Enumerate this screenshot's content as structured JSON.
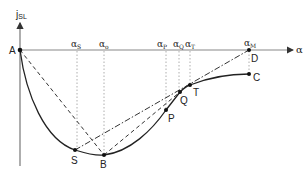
{
  "diagram": {
    "y_axis_label": "j",
    "y_axis_subscript": "SL",
    "x_axis_label": "α",
    "alpha_marks": [
      {
        "base": "α",
        "sub": "S",
        "x": 77
      },
      {
        "base": "α",
        "sub": "o",
        "x": 104
      },
      {
        "base": "α",
        "sub": "P",
        "x": 166
      },
      {
        "base": "α",
        "sub": "Q",
        "x": 179
      },
      {
        "base": "α",
        "sub": "T",
        "x": 190
      },
      {
        "base": "α",
        "sub": "M",
        "x": 249
      }
    ],
    "points": {
      "A": "A",
      "S": "S",
      "B": "B",
      "P": "P",
      "Q": "Q",
      "T": "T",
      "C": "C",
      "D": "D"
    },
    "colors": {
      "line": "#222222",
      "axis": "#888888",
      "guide": "#999999"
    }
  }
}
